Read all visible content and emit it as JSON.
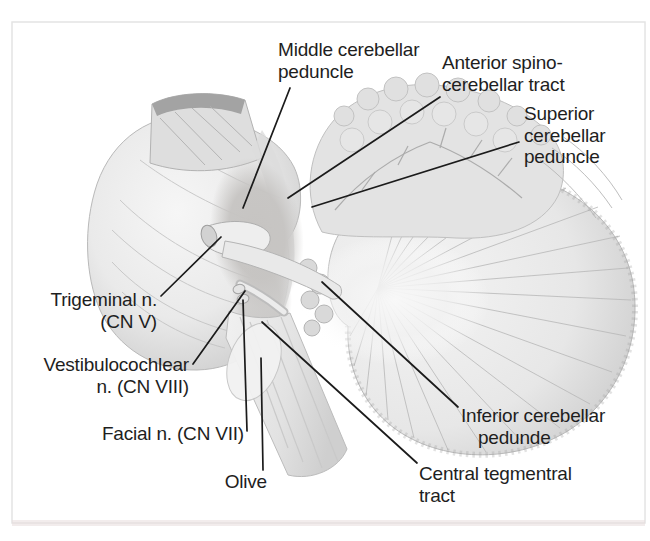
{
  "figure": {
    "labels": [
      {
        "id": "middle-cerebellar-peduncle",
        "lines": [
          "Middle cerebellar",
          "peduncle"
        ]
      },
      {
        "id": "anterior-spinocerebellar-tract",
        "lines": [
          "Anterior spino-",
          "cerebellar tract"
        ]
      },
      {
        "id": "superior-cerebellar-peduncle",
        "lines": [
          "Superior",
          "cerebellar",
          "peduncle"
        ]
      },
      {
        "id": "trigeminal-nerve",
        "lines": [
          "Trigeminal n.",
          "(CN V)"
        ]
      },
      {
        "id": "vestibulocochlear-nerve",
        "lines": [
          "Vestibulocochlear",
          "n. (CN VIII)"
        ]
      },
      {
        "id": "facial-nerve",
        "lines": [
          "Facial n. (CN VII)"
        ]
      },
      {
        "id": "olive",
        "lines": [
          "Olive"
        ]
      },
      {
        "id": "inferior-cerebellar-peduncle",
        "lines": [
          "Inferior cerebellar",
          "pedunde"
        ]
      },
      {
        "id": "central-tegmental-tract",
        "lines": [
          "Central tegmentral",
          "tract"
        ]
      }
    ],
    "colors": {
      "background": "#ffffff",
      "leader_line": "#1b1b1b",
      "text": "#1e1e1e",
      "frame_border": "#e4e4e4",
      "bottom_tint": "#e8dcdc",
      "art_light": "#f2f2f2",
      "art_mid": "#d9d9d9",
      "art_dark": "#a3a3a3"
    }
  }
}
